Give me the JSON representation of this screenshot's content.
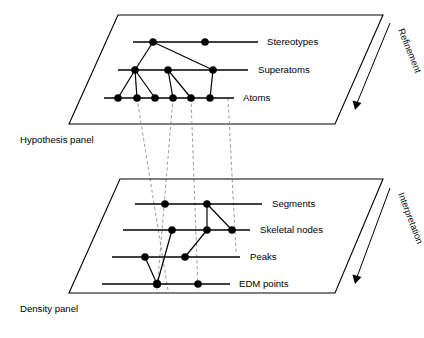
{
  "figure": {
    "background_color": "#ffffff",
    "ink_color": "#000000",
    "dashed_color": "#8a8a8a"
  },
  "panels": [
    {
      "id": "hypothesis",
      "caption": "Hypothesis panel",
      "arrow_label": "Refinement",
      "rows": [
        {
          "id": "stereotypes",
          "label": "Stereotypes",
          "node_count": 2
        },
        {
          "id": "superatoms",
          "label": "Superatoms",
          "node_count": 3
        },
        {
          "id": "atoms",
          "label": "Atoms",
          "node_count": 6
        }
      ]
    },
    {
      "id": "density",
      "caption": "Density panel",
      "arrow_label": "Interpretation",
      "rows": [
        {
          "id": "segments",
          "label": "Segments",
          "node_count": 2
        },
        {
          "id": "skeletal-nodes",
          "label": "Skeletal nodes",
          "node_count": 3
        },
        {
          "id": "peaks",
          "label": "Peaks",
          "node_count": 2
        },
        {
          "id": "edm-points",
          "label": "EDM points",
          "node_count": 2
        }
      ]
    }
  ],
  "labels": {
    "stereotypes": "Stereotypes",
    "superatoms": "Superatoms",
    "atoms": "Atoms",
    "segments": "Segments",
    "skeletal_nodes": "Skeletal nodes",
    "peaks": "Peaks",
    "edm_points": "EDM points",
    "hypothesis_panel": "Hypothesis panel",
    "density_panel": "Density panel",
    "refinement": "Refinement",
    "interpretation": "Interpretation"
  }
}
